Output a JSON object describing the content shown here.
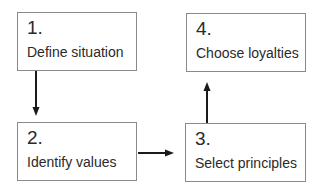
{
  "diagram": {
    "type": "flowchart",
    "steps": [
      {
        "number": "1.",
        "label": "Define situation"
      },
      {
        "number": "2.",
        "label": "Identify values"
      },
      {
        "number": "3.",
        "label": "Select principles"
      },
      {
        "number": "4.",
        "label": "Choose loyalties"
      }
    ],
    "edges": [
      {
        "from": "1",
        "to": "2",
        "direction": "down"
      },
      {
        "from": "2",
        "to": "3",
        "direction": "right"
      },
      {
        "from": "3",
        "to": "4",
        "direction": "up"
      }
    ],
    "colors": {
      "border": "#8a8a8a",
      "arrow": "#1a1a1a",
      "text": "#2a2a2a"
    }
  }
}
